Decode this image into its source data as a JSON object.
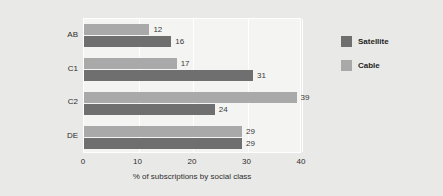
{
  "chart_data": {
    "type": "bar",
    "orientation": "horizontal",
    "title": "",
    "xlabel": "% of subscriptions by social class",
    "ylabel": "",
    "categories": [
      "AB",
      "C1",
      "C2",
      "DE"
    ],
    "series": [
      {
        "name": "Satellite",
        "color": "#6f6f6f",
        "values": [
          16,
          31,
          24,
          29
        ]
      },
      {
        "name": "Cable",
        "color": "#a9a9a9",
        "values": [
          12,
          17,
          39,
          29
        ]
      }
    ],
    "xlim": [
      0,
      40
    ],
    "xticks": [
      0,
      10,
      20,
      30,
      40
    ],
    "xtick_labels": [
      "0",
      "10",
      "20",
      "30",
      "40"
    ],
    "grid": true,
    "grid_color": "#ffffff",
    "legend_position": "right",
    "plot_background": "#f4f4f2",
    "figure_background": "#e9e9e7",
    "data_labels": true,
    "group_order_top_to_bottom": [
      "Cable",
      "Satellite"
    ]
  },
  "legend": {
    "items": [
      {
        "label": "Satellite",
        "color": "#6f6f6f"
      },
      {
        "label": "Cable",
        "color": "#a9a9a9"
      }
    ]
  },
  "axis": {
    "x_label": "% of subscriptions by social class",
    "x_ticks": [
      "0",
      "10",
      "20",
      "30",
      "40"
    ],
    "y_ticks": [
      "AB",
      "C1",
      "C2",
      "DE"
    ]
  }
}
